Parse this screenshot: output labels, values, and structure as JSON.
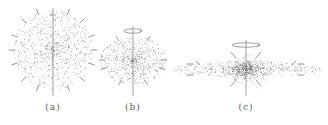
{
  "figure": {
    "background": "#ffffff",
    "dot_color": "#5a5a5a",
    "line_color": "#8a8a8a",
    "panels": [
      {
        "id": "a",
        "label": "(a)",
        "cx": 53,
        "cy": 50,
        "rx": 40,
        "ry": 40,
        "axis_top": 8,
        "axis_bottom": 96,
        "rotation_ring": false,
        "ring_rx": 0,
        "dot_count": 900,
        "arrows": [
          {
            "angle": -112
          },
          {
            "angle": -68
          },
          {
            "angle": -135
          },
          {
            "angle": -45
          },
          {
            "angle": -160
          },
          {
            "angle": -20
          },
          {
            "angle": 180
          },
          {
            "angle": 0
          },
          {
            "angle": 160
          },
          {
            "angle": 20
          },
          {
            "angle": 135
          },
          {
            "angle": 45
          },
          {
            "angle": 112
          },
          {
            "angle": 68
          }
        ],
        "arrow_radius": 44,
        "caption_x": 53,
        "caption_y": 104
      },
      {
        "id": "b",
        "label": "(b)",
        "cx": 133,
        "cy": 60,
        "rx": 33,
        "ry": 24,
        "axis_top": 26,
        "axis_bottom": 96,
        "rotation_ring": true,
        "ring_y": 31,
        "ring_rx": 9,
        "dot_count": 700,
        "arrows": [
          {
            "angle": -120
          },
          {
            "angle": -60
          },
          {
            "angle": 180
          },
          {
            "angle": 0
          },
          {
            "angle": 160
          },
          {
            "angle": 20
          },
          {
            "angle": 115
          },
          {
            "angle": 65
          }
        ],
        "arrow_radius": 34,
        "caption_x": 133,
        "caption_y": 104
      },
      {
        "id": "c",
        "label": "(c)",
        "cx": 246,
        "cy": 69,
        "rx": 75,
        "ry": 8,
        "core_rx": 14,
        "core_ry": 12,
        "axis_top": 40,
        "axis_bottom": 96,
        "rotation_ring": true,
        "ring_y": 45,
        "ring_rx": 14,
        "dot_count": 1000,
        "arrows": [
          {
            "x1": 196,
            "y1": 61,
            "x2": 200,
            "y2": 65
          },
          {
            "x1": 296,
            "y1": 61,
            "x2": 292,
            "y2": 65
          },
          {
            "x1": 231,
            "y1": 52,
            "x2": 236,
            "y2": 58
          },
          {
            "x1": 261,
            "y1": 52,
            "x2": 256,
            "y2": 58
          },
          {
            "x1": 231,
            "y1": 86,
            "x2": 236,
            "y2": 80
          },
          {
            "x1": 261,
            "y1": 86,
            "x2": 256,
            "y2": 80
          },
          {
            "x1": 187,
            "y1": 64,
            "x2": 193,
            "y2": 64
          },
          {
            "x1": 187,
            "y1": 75,
            "x2": 193,
            "y2": 75
          },
          {
            "x1": 304,
            "y1": 64,
            "x2": 298,
            "y2": 64
          },
          {
            "x1": 304,
            "y1": 75,
            "x2": 298,
            "y2": 75
          }
        ],
        "caption_x": 246,
        "caption_y": 104
      }
    ]
  }
}
